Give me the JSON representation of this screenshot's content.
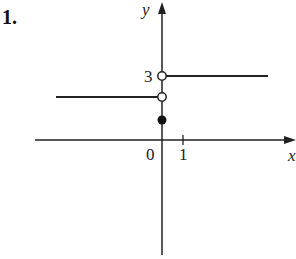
{
  "problem": {
    "number": "1."
  },
  "axes": {
    "x_label": "x",
    "y_label": "y",
    "origin_label": "0",
    "x_tick_label": "1",
    "y_tick_label": "3"
  },
  "graph": {
    "type": "piecewise step function",
    "pieces": [
      {
        "domain": "x < 0",
        "value": "a (between 0 and 3)",
        "endpoint": "open circle at x=0"
      },
      {
        "domain": "x > 0",
        "value": 3,
        "endpoint": "open circle at (0,3)"
      }
    ],
    "point": {
      "x": 0,
      "value": "filled circle below the lower piece, above 0"
    }
  },
  "colors": {
    "ink": "#222222",
    "background": "#ffffff"
  }
}
